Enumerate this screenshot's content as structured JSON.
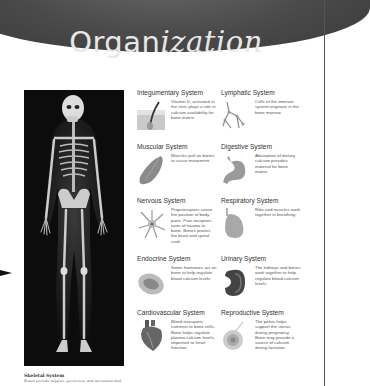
{
  "header": {
    "title_regular": "Organ",
    "title_italic": "ization"
  },
  "skeleton": {
    "caption_title": "Skeletal System",
    "caption_text": "Bones provide support, protection, and movement and"
  },
  "systems": [
    {
      "name": "Integumentary System",
      "icon": "skin-hair-icon",
      "desc": "Vitamin D, activated in the skin, plays a role in calcium availability for bone matrix."
    },
    {
      "name": "Lymphatic System",
      "icon": "lymph-vessels-icon",
      "desc": "Cells of the immune system originate in the bone marrow."
    },
    {
      "name": "Muscular System",
      "icon": "muscle-icon",
      "desc": "Muscles pull on bones to cause movement."
    },
    {
      "name": "Digestive System",
      "icon": "stomach-icon",
      "desc": "Absorption of dietary calcium provides material for bone matrix."
    },
    {
      "name": "Nervous System",
      "icon": "neuron-icon",
      "desc": "Proprioceptors sense the position of body parts. Pain receptors warn of trauma to bone. Bones protect the brain and spinal cord."
    },
    {
      "name": "Respiratory System",
      "icon": "lung-icon",
      "desc": "Ribs and muscles work together in breathing."
    },
    {
      "name": "Endocrine System",
      "icon": "thyroid-icon",
      "desc": "Some hormones act on bone to help regulate blood calcium levels."
    },
    {
      "name": "Urinary System",
      "icon": "kidney-icon",
      "desc": "The kidneys and bones work together to help regulate blood calcium levels."
    },
    {
      "name": "Cardiovascular System",
      "icon": "heart-icon",
      "desc": "Blood transports nutrients to bone cells. Bone helps regulate plasma calcium levels, important to heart function."
    },
    {
      "name": "Reproductive System",
      "icon": "ovum-icon",
      "desc": "The pelvis helps support the uterus during pregnancy. Bone may provide a source of calcium during lactation."
    }
  ]
}
